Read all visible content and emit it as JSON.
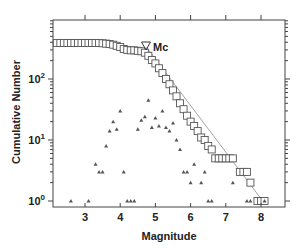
{
  "chart_data": {
    "type": "scatter",
    "title": "",
    "xlabel": "Magnitude",
    "ylabel": "Cumulative Number",
    "xlim": [
      2.1,
      8.7
    ],
    "ylim": [
      0.93,
      930
    ],
    "yscale": "log",
    "grid": false,
    "x_ticks": [
      3,
      4,
      5,
      6,
      7,
      8
    ],
    "y_ticks": [
      {
        "value": 1,
        "base": "10",
        "exp": "0"
      },
      {
        "value": 10,
        "base": "10",
        "exp": "1"
      },
      {
        "value": 100,
        "base": "10",
        "exp": "2"
      }
    ],
    "legend": {
      "position": "top-right-inside",
      "entries": [
        {
          "marker": "open-down-triangle",
          "label": "Mc"
        }
      ]
    },
    "annotations": [
      {
        "type": "marker",
        "label": "Mc",
        "x": 4.75,
        "y": 330
      }
    ],
    "series": [
      {
        "name": "Cumulative number",
        "marker": "open-square",
        "x": [
          2.2,
          2.3,
          2.4,
          2.5,
          2.6,
          2.7,
          2.8,
          2.9,
          3.0,
          3.1,
          3.2,
          3.3,
          3.4,
          3.5,
          3.6,
          3.7,
          3.8,
          3.9,
          4.0,
          4.1,
          4.2,
          4.3,
          4.4,
          4.5,
          4.6,
          4.7,
          4.8,
          4.9,
          5.0,
          5.1,
          5.2,
          5.3,
          5.4,
          5.5,
          5.6,
          5.7,
          5.8,
          5.9,
          6.0,
          6.1,
          6.2,
          6.3,
          6.4,
          6.5,
          6.6,
          6.7,
          6.8,
          6.9,
          7.0,
          7.1,
          7.2,
          7.4,
          7.5,
          7.6,
          7.7,
          7.9,
          8.0,
          8.1
        ],
        "y": [
          390,
          390,
          390,
          390,
          390,
          390,
          390,
          390,
          390,
          390,
          390,
          390,
          390,
          385,
          380,
          375,
          365,
          350,
          335,
          310,
          300,
          295,
          295,
          290,
          285,
          270,
          240,
          205,
          180,
          150,
          125,
          100,
          82,
          65,
          52,
          40,
          32,
          25,
          20,
          17,
          14,
          11,
          10,
          8,
          7,
          5,
          5,
          5,
          5,
          5,
          5,
          3,
          3,
          3,
          2,
          1,
          1,
          1
        ]
      },
      {
        "name": "Non-cumulative number",
        "marker": "small-filled-triangle",
        "x": [
          2.6,
          3.1,
          3.3,
          3.4,
          3.5,
          3.6,
          3.7,
          3.8,
          3.9,
          4.0,
          4.1,
          4.2,
          4.3,
          4.4,
          4.5,
          4.6,
          4.7,
          4.8,
          4.9,
          5.0,
          5.1,
          5.2,
          5.3,
          5.4,
          5.5,
          5.6,
          5.7,
          5.8,
          5.9,
          6.0,
          6.1,
          6.3,
          6.4,
          6.5,
          6.6,
          7.2,
          7.6,
          7.7,
          8.1
        ],
        "y": [
          1,
          1,
          4,
          3,
          3,
          8,
          14,
          20,
          15,
          30,
          3,
          1,
          1,
          1,
          15,
          21,
          24,
          45,
          16,
          23,
          17,
          30,
          16,
          14,
          19,
          10,
          7,
          3,
          3,
          2,
          4,
          2,
          3,
          1,
          1,
          2,
          1,
          1,
          1
        ]
      },
      {
        "name": "Gutenberg-Richter fit",
        "type": "line",
        "x": [
          4.75,
          8.05
        ],
        "y": [
          330,
          1
        ]
      }
    ]
  }
}
